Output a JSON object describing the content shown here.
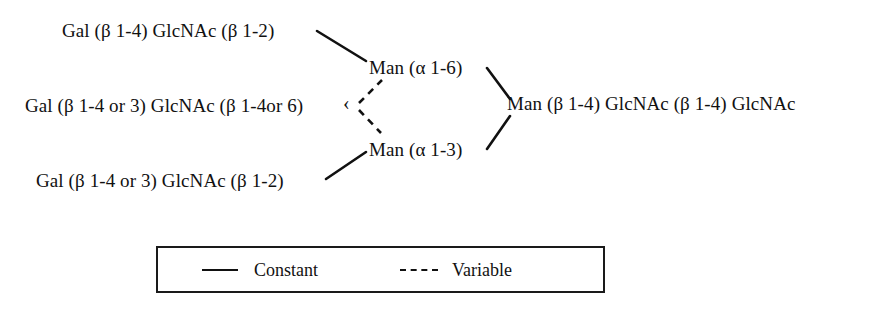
{
  "diagram": {
    "nodes": [
      {
        "id": "upper_antenna",
        "label": "Gal (β 1-4) GlcNAc (β 1-2)"
      },
      {
        "id": "middle_antenna",
        "label": "Gal (β 1-4 or 3) GlcNAc (β 1-4or 6)"
      },
      {
        "id": "lower_antenna",
        "label": "Gal (β 1-4 or 3) GlcNAc (β 1-2)"
      },
      {
        "id": "man_alpha_1_6",
        "label": "Man (α 1-6)"
      },
      {
        "id": "man_alpha_1_3",
        "label": "Man (α 1-3)"
      },
      {
        "id": "core",
        "label": "Man (β 1-4) GlcNAc (β 1-4) GlcNAc"
      }
    ],
    "bracket": "‹",
    "line_color": "#111111"
  },
  "legend": {
    "entries": [
      {
        "id": "constant",
        "label": "Constant",
        "style": "solid"
      },
      {
        "id": "variable",
        "label": "Variable",
        "style": "dashed"
      }
    ]
  }
}
